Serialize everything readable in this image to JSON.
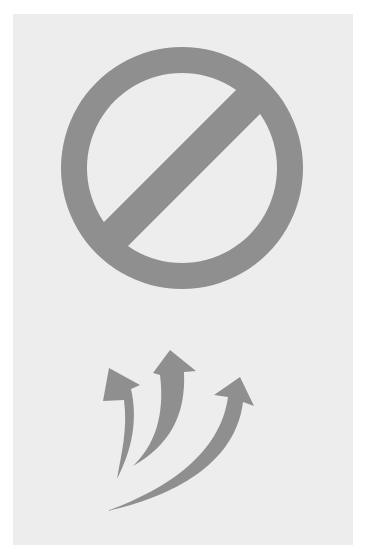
{
  "image": {
    "description": "Prohibition sign above three curved upward arrows on a light gray card",
    "width": 367,
    "height": 557
  },
  "colors": {
    "page_background": "#ffffff",
    "card_background": "#ededed",
    "symbol_fill": "#8f8f8f"
  },
  "symbols": {
    "prohibition": {
      "icon": "no-entry-icon",
      "label": "Prohibited",
      "center": [
        182,
        168
      ],
      "outer_radius": 121,
      "ring_thickness": 26
    },
    "arrows": {
      "icon": "curved-arrows-up-icon",
      "label": "Rising arrows",
      "count": 3,
      "items": [
        {
          "name": "left-arrow",
          "tip": [
            109,
            368
          ],
          "tail": [
            117,
            478
          ]
        },
        {
          "name": "middle-arrow",
          "tip": [
            170,
            350
          ],
          "tail": [
            133,
            465
          ]
        },
        {
          "name": "right-arrow",
          "tip": [
            240,
            377
          ],
          "tail": [
            108,
            510
          ]
        }
      ]
    }
  }
}
